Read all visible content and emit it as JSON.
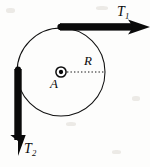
{
  "figure": {
    "kind": "physics-free-body-diagram",
    "background_color": "#fdfdfc",
    "ink_color": "#0a0a0a",
    "width": 150,
    "height": 167,
    "labels": {
      "tension_top": "T",
      "tension_top_sub": "1",
      "tension_left": "T",
      "tension_left_sub": "2",
      "radius": "R",
      "axis_point": "A"
    },
    "geometry": {
      "circle_center_x": 61,
      "circle_center_y": 72,
      "circle_radius": 44,
      "circle_stroke_width": 1.1,
      "hub_outer_radius": 5.2,
      "hub_inner_radius": 2.2,
      "radius_line_from_x": 66,
      "radius_line_from_y": 72,
      "radius_line_to_x": 105,
      "radius_line_to_y": 72,
      "radius_line_dash": "1.4 2.1",
      "band_thickness": 7.5,
      "arrow_top_start_x": 61,
      "arrow_top_start_y": 27,
      "arrow_top_end_x": 150,
      "arrow_top_end_y": 27,
      "arrow_left_start_x": 18,
      "arrow_left_start_y": 70,
      "arrow_left_end_x": 18,
      "arrow_left_end_y": 156,
      "arrowhead_length": 17,
      "arrowhead_halfwidth": 7.5
    }
  }
}
